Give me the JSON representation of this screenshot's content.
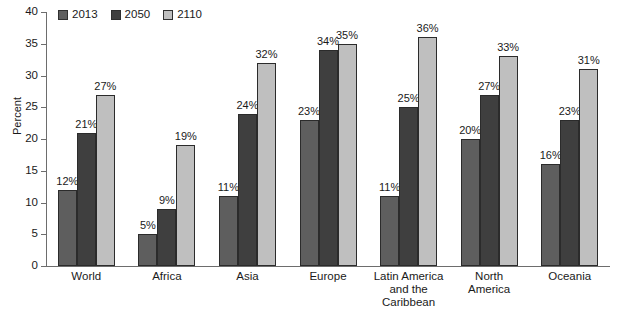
{
  "chart_data": {
    "type": "bar",
    "title": "",
    "subtitle": "",
    "xlabel": "",
    "ylabel": "Percent",
    "ylim": [
      0,
      40
    ],
    "ytick_labels": [
      "0",
      "5",
      "10",
      "15",
      "20",
      "25",
      "30",
      "35",
      "40"
    ],
    "yticks": [
      0,
      5,
      10,
      15,
      20,
      25,
      30,
      35,
      40
    ],
    "grid": false,
    "legend_position": "top-left",
    "value_suffix": "%",
    "categories": [
      "World",
      "Africa",
      "Asia",
      "Europe",
      "Latin America and the Caribbean",
      "North America",
      "Oceania"
    ],
    "category_label_lines": [
      [
        "World"
      ],
      [
        "Africa"
      ],
      [
        "Asia"
      ],
      [
        "Europe"
      ],
      [
        "Latin America",
        "and the",
        "Caribbean"
      ],
      [
        "North",
        "America"
      ],
      [
        "Oceania"
      ]
    ],
    "series": [
      {
        "name": "2013",
        "color": "#5e5e5e",
        "values": [
          12,
          5,
          11,
          23,
          11,
          20,
          16
        ],
        "labels": [
          "12%",
          "5%",
          "11%",
          "23%",
          "11%",
          "20%",
          "16%"
        ]
      },
      {
        "name": "2050",
        "color": "#3f3f3f",
        "values": [
          21,
          9,
          24,
          34,
          25,
          27,
          23
        ],
        "labels": [
          "21%",
          "9%",
          "24%",
          "34%",
          "25%",
          "27%",
          "23%"
        ]
      },
      {
        "name": "2110",
        "color": "#bfbfbf",
        "values": [
          27,
          19,
          32,
          35,
          36,
          33,
          31
        ],
        "labels": [
          "27%",
          "19%",
          "32%",
          "35%",
          "36%",
          "33%",
          "31%"
        ]
      }
    ]
  },
  "legend": {
    "items": [
      {
        "label": "2013"
      },
      {
        "label": "2050"
      },
      {
        "label": "2110"
      }
    ]
  },
  "axis": {
    "y_title": "Percent"
  }
}
